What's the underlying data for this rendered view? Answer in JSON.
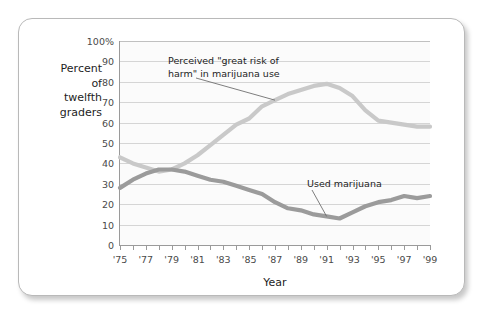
{
  "chart_data": {
    "type": "line",
    "title": "",
    "xlabel": "Year",
    "ylabel": "Percent of twelfth graders",
    "ylabel_lines": "Percent\nof\ntwelfth\ngraders",
    "ylim": [
      0,
      100
    ],
    "xlim": [
      1975,
      1999
    ],
    "grid": true,
    "legend_position": "inline-annotations",
    "ytick_labels": [
      "100%",
      "90",
      "80",
      "70",
      "60",
      "50",
      "40",
      "30",
      "20",
      "10",
      "0"
    ],
    "ytick_values": [
      100,
      90,
      80,
      70,
      60,
      50,
      40,
      30,
      20,
      10,
      0
    ],
    "xtick_labels": [
      "'75",
      "'77",
      "'79",
      "'81",
      "'83",
      "'85",
      "'87",
      "'89",
      "'91",
      "'93",
      "'95",
      "'97",
      "'99"
    ],
    "xtick_values": [
      1975,
      1977,
      1979,
      1981,
      1983,
      1985,
      1987,
      1989,
      1991,
      1993,
      1995,
      1997,
      1999
    ],
    "minor_tick_years": [
      1975,
      1976,
      1977,
      1978,
      1979,
      1980,
      1981,
      1982,
      1983,
      1984,
      1985,
      1986,
      1987,
      1988,
      1989,
      1990,
      1991,
      1992,
      1993,
      1994,
      1995,
      1996,
      1997,
      1998,
      1999
    ],
    "x": [
      1975,
      1976,
      1977,
      1978,
      1979,
      1980,
      1981,
      1982,
      1983,
      1984,
      1985,
      1986,
      1987,
      1988,
      1989,
      1990,
      1991,
      1992,
      1993,
      1994,
      1995,
      1996,
      1997,
      1998,
      1999
    ],
    "series": [
      {
        "name": "Perceived \"great risk of harm\" in marijuana use",
        "color": "#c9c9c9",
        "values": [
          43,
          40,
          38,
          36,
          37,
          40,
          44,
          49,
          54,
          59,
          62,
          68,
          71,
          74,
          76,
          78,
          79,
          77,
          73,
          66,
          61,
          60,
          59,
          58,
          58
        ]
      },
      {
        "name": "Used marijuana",
        "color": "#9b9b9b",
        "values": [
          28,
          32,
          35,
          37,
          37,
          36,
          34,
          32,
          31,
          29,
          27,
          25,
          21,
          18,
          17,
          15,
          14,
          13,
          16,
          19,
          21,
          22,
          24,
          23,
          24
        ]
      }
    ],
    "annotations": [
      {
        "id": "risk-annotation",
        "text": "Perceived \"great risk of\nharm\" in marijuana use",
        "points_to_year": 1987,
        "points_to_value": 71
      },
      {
        "id": "used-annotation",
        "text": "Used marijuana",
        "points_to_year": 1991,
        "points_to_value": 14
      }
    ]
  }
}
